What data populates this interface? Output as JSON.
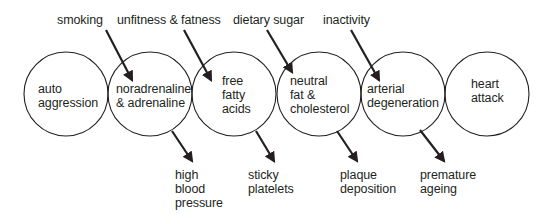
{
  "diagram": {
    "colors": {
      "ink": "#231f20",
      "background": "#ffffff"
    },
    "nodes": [
      {
        "id": "auto-aggression",
        "lines": [
          "auto",
          "aggression"
        ],
        "cx": 66,
        "cy": 94,
        "r": 42
      },
      {
        "id": "noradrenaline",
        "lines": [
          "noradrenaline",
          "& adrenaline"
        ],
        "cx": 150,
        "cy": 94,
        "r": 42
      },
      {
        "id": "free-fatty-acids",
        "lines": [
          "free",
          "fatty",
          "acids"
        ],
        "cx": 234,
        "cy": 94,
        "r": 42
      },
      {
        "id": "neutral-fat",
        "lines": [
          "neutral",
          "fat &",
          "cholesterol"
        ],
        "cx": 319,
        "cy": 94,
        "r": 42
      },
      {
        "id": "arterial-degeneration",
        "lines": [
          "arterial",
          "degeneration"
        ],
        "cx": 403,
        "cy": 94,
        "r": 42
      },
      {
        "id": "heart-attack",
        "lines": [
          "heart",
          "attack"
        ],
        "cx": 487,
        "cy": 94,
        "r": 42
      }
    ],
    "inputs": [
      {
        "label": "smoking",
        "target": "noradrenaline"
      },
      {
        "label": "unfitness & fatness",
        "target": "free-fatty-acids"
      },
      {
        "label": "dietary sugar",
        "target": "neutral-fat"
      },
      {
        "label": "inactivity",
        "target": "arterial-degeneration"
      }
    ],
    "outputs": [
      {
        "lines": [
          "high",
          "blood",
          "pressure"
        ],
        "source": "noradrenaline"
      },
      {
        "lines": [
          "sticky",
          "platelets"
        ],
        "source": "free-fatty-acids"
      },
      {
        "lines": [
          "plaque",
          "deposition"
        ],
        "source": "neutral-fat"
      },
      {
        "lines": [
          "premature",
          "ageing"
        ],
        "source": "arterial-degeneration"
      }
    ]
  }
}
